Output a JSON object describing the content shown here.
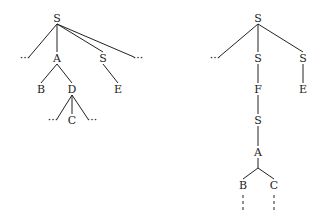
{
  "diagram": {
    "type": "parse-trees",
    "left_tree": {
      "nodes": [
        {
          "id": "l_root",
          "label": "S",
          "x": 57,
          "y": 18
        },
        {
          "id": "l_ell1",
          "label": "...",
          "x": 25,
          "y": 58
        },
        {
          "id": "l_A",
          "label": "A",
          "x": 57,
          "y": 58
        },
        {
          "id": "l_S2",
          "label": "S",
          "x": 103,
          "y": 58
        },
        {
          "id": "l_ell2",
          "label": "...",
          "x": 138,
          "y": 58
        },
        {
          "id": "l_B",
          "label": "B",
          "x": 41,
          "y": 89
        },
        {
          "id": "l_D",
          "label": "D",
          "x": 72,
          "y": 89
        },
        {
          "id": "l_E",
          "label": "E",
          "x": 118,
          "y": 89
        },
        {
          "id": "l_ell3",
          "label": "...",
          "x": 53,
          "y": 120
        },
        {
          "id": "l_C",
          "label": "C",
          "x": 72,
          "y": 120
        },
        {
          "id": "l_ell4",
          "label": "...",
          "x": 92,
          "y": 120
        }
      ],
      "edges": [
        [
          "l_root",
          "l_ell1"
        ],
        [
          "l_root",
          "l_A"
        ],
        [
          "l_root",
          "l_S2"
        ],
        [
          "l_root",
          "l_ell2"
        ],
        [
          "l_A",
          "l_B"
        ],
        [
          "l_A",
          "l_D"
        ],
        [
          "l_S2",
          "l_E"
        ],
        [
          "l_D",
          "l_ell3"
        ],
        [
          "l_D",
          "l_C"
        ],
        [
          "l_D",
          "l_ell4"
        ]
      ]
    },
    "right_tree": {
      "nodes": [
        {
          "id": "r_root",
          "label": "S",
          "x": 258,
          "y": 18
        },
        {
          "id": "r_ell1",
          "label": "...",
          "x": 215,
          "y": 58
        },
        {
          "id": "r_S1",
          "label": "S",
          "x": 258,
          "y": 58
        },
        {
          "id": "r_S2",
          "label": "S",
          "x": 303,
          "y": 58
        },
        {
          "id": "r_F",
          "label": "F",
          "x": 258,
          "y": 89
        },
        {
          "id": "r_E",
          "label": "E",
          "x": 303,
          "y": 89
        },
        {
          "id": "r_S3",
          "label": "S",
          "x": 258,
          "y": 120
        },
        {
          "id": "r_A",
          "label": "A",
          "x": 258,
          "y": 152
        },
        {
          "id": "r_B",
          "label": "B",
          "x": 243,
          "y": 185
        },
        {
          "id": "r_C",
          "label": "C",
          "x": 274,
          "y": 185
        }
      ],
      "edges": [
        [
          "r_root",
          "r_ell1"
        ],
        [
          "r_root",
          "r_S1"
        ],
        [
          "r_root",
          "r_S2"
        ],
        [
          "r_S1",
          "r_F"
        ],
        [
          "r_S2",
          "r_E"
        ],
        [
          "r_F",
          "r_S3"
        ],
        [
          "r_S3",
          "r_A"
        ]
      ],
      "branch": {
        "from": "r_A",
        "junction": {
          "x": 258,
          "y": 168
        },
        "to": [
          "r_B",
          "r_C"
        ]
      },
      "dashed_continuations": [
        "r_B",
        "r_C"
      ]
    }
  }
}
